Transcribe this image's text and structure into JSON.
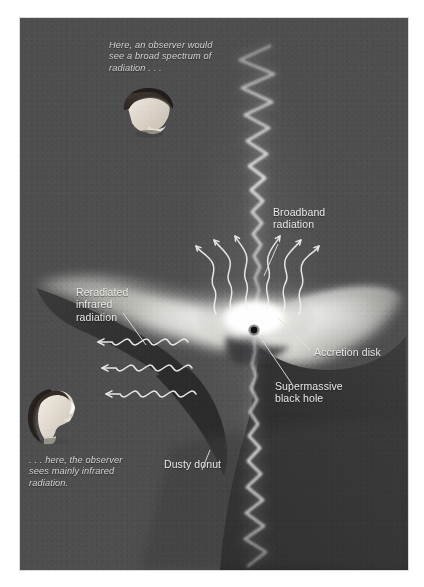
{
  "figure": {
    "panel_bg": "#4f4f50",
    "label_color": "#e9e9e6"
  },
  "annotations": {
    "top_observer_note": "Here, an observer would\nsee a broad spectrum of\nradiation . . .",
    "bottom_observer_note": ". . . here, the observer\nsees mainly infrared\nradiation.",
    "broadband_radiation": "Broadband\nradiation",
    "reradiated_infrared": "Reradiated\ninfrared\nradiation",
    "accretion_disk": "Accretion disk",
    "supermassive_black_hole": "Supermassive\nblack hole",
    "dusty_donut": "Dusty donut"
  },
  "elements": {
    "jet": "relativistic-jet",
    "disk": "accretion-disk",
    "torus": "dusty-torus",
    "black_hole": "black-hole-point",
    "uv_arrows": "broadband-radiation-squiggles",
    "ir_waves": "infrared-sine-waves",
    "observer_top": "observer-head-top",
    "observer_bottom": "observer-head-bottom"
  }
}
